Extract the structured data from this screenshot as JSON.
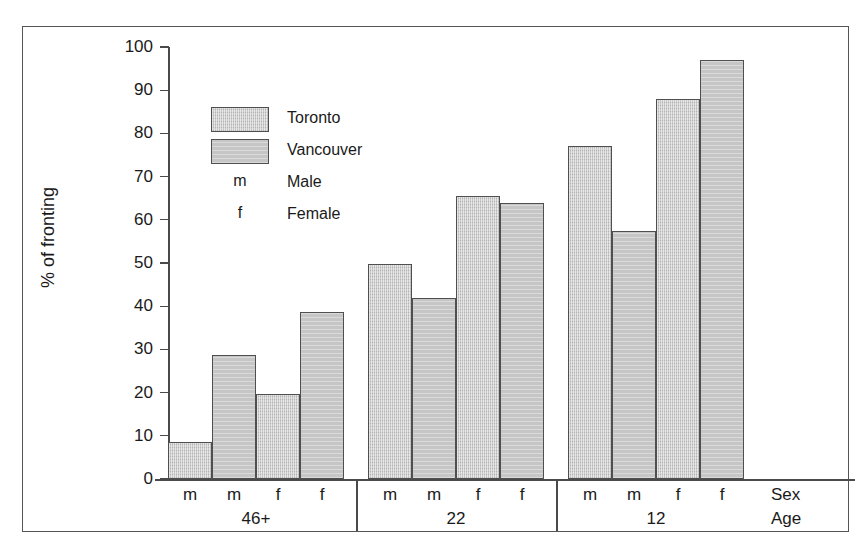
{
  "caption_fragment": "",
  "chart_data": {
    "type": "bar",
    "title": "",
    "subtitle": "",
    "xlabel": "Age",
    "ylabel": "% of fronting",
    "ylim": [
      0,
      100
    ],
    "y_ticks": [
      0,
      10,
      20,
      30,
      40,
      50,
      60,
      70,
      80,
      90,
      100
    ],
    "grid": false,
    "legend_position": "upper-left-inside",
    "axis_names": {
      "sex_row": "Sex",
      "age_row": "Age"
    },
    "legend": [
      {
        "key": "swatch",
        "style": "toronto",
        "label": "Toronto"
      },
      {
        "key": "swatch",
        "style": "vancouver",
        "label": "Vancouver"
      },
      {
        "key": "m",
        "style": "text",
        "label": "Male"
      },
      {
        "key": "f",
        "style": "text",
        "label": "Female"
      }
    ],
    "series": [
      {
        "name": "Toronto",
        "values": [
          8.5,
          19.7,
          49.8,
          65.5,
          77.0,
          88.0
        ]
      },
      {
        "name": "Vancouver",
        "values": [
          28.7,
          38.7,
          42.0,
          64.0,
          57.5,
          97.0
        ]
      }
    ],
    "groups": [
      {
        "age": "46+",
        "bars": [
          {
            "sex": "m",
            "city": "Toronto",
            "value": 8.5
          },
          {
            "sex": "m",
            "city": "Vancouver",
            "value": 28.7
          },
          {
            "sex": "f",
            "city": "Toronto",
            "value": 19.7
          },
          {
            "sex": "f",
            "city": "Vancouver",
            "value": 38.7
          }
        ]
      },
      {
        "age": "22",
        "bars": [
          {
            "sex": "m",
            "city": "Toronto",
            "value": 49.8
          },
          {
            "sex": "m",
            "city": "Vancouver",
            "value": 42.0
          },
          {
            "sex": "f",
            "city": "Toronto",
            "value": 65.5
          },
          {
            "sex": "f",
            "city": "Vancouver",
            "value": 64.0
          }
        ]
      },
      {
        "age": "12",
        "bars": [
          {
            "sex": "m",
            "city": "Toronto",
            "value": 77.0
          },
          {
            "sex": "m",
            "city": "Vancouver",
            "value": 57.5
          },
          {
            "sex": "f",
            "city": "Toronto",
            "value": 88.0
          },
          {
            "sex": "f",
            "city": "Vancouver",
            "value": 97.0
          }
        ]
      }
    ],
    "colors": {
      "toronto_fill": "#c9c9c9",
      "vancouver_fill": "#c6c6c6",
      "bar_stroke": "#4f4f4f",
      "axis": "#4a4a4a",
      "frame": "#555555",
      "text": "#1a1a1a",
      "background": "#ffffff"
    }
  }
}
